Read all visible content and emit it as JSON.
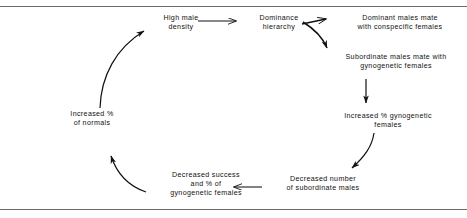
{
  "figure": {
    "background_color": "#ffffff",
    "line_color": "#111111",
    "rule_color": "#6a6a6a"
  },
  "nodes": [
    {
      "id": "high-male-density",
      "lines": [
        "High male",
        "density"
      ]
    },
    {
      "id": "dominance-hierarchy",
      "lines": [
        "Dominance",
        "hierarchy"
      ]
    },
    {
      "id": "dominant-males",
      "lines": [
        "Dominant males mate",
        "with conspecific females"
      ]
    },
    {
      "id": "subordinate-males-mate",
      "lines": [
        "Subordinate males mate with",
        "gynogenetic females"
      ]
    },
    {
      "id": "increased-gyno",
      "lines": [
        "Increased % gynogenetic",
        "females"
      ]
    },
    {
      "id": "decreased-number",
      "lines": [
        "Decreased number",
        "of subordinate males"
      ]
    },
    {
      "id": "decreased-success",
      "lines": [
        "Decreased success",
        "and % of",
        "gynogenetic females"
      ]
    },
    {
      "id": "increased-normals",
      "lines": [
        "Increased %",
        "of  normals"
      ]
    }
  ],
  "edges": [
    {
      "id": "high-male-density-to-dominance-hierarchy",
      "shape": "straight",
      "direction": "right"
    },
    {
      "id": "dominance-hierarchy-to-dominant-males",
      "shape": "straight",
      "direction": "right"
    },
    {
      "id": "dominance-hierarchy-to-subordinate-males",
      "shape": "curved",
      "direction": "down-right"
    },
    {
      "id": "subordinate-males-to-increased-gyno",
      "shape": "straight",
      "direction": "down"
    },
    {
      "id": "increased-gyno-to-decreased-number",
      "shape": "curved",
      "direction": "down-left"
    },
    {
      "id": "decreased-number-to-decreased-success",
      "shape": "straight",
      "direction": "left"
    },
    {
      "id": "decreased-success-to-increased-normals",
      "shape": "curved",
      "direction": "up-left"
    },
    {
      "id": "increased-normals-to-high-male-density",
      "shape": "curved",
      "direction": "up-right"
    }
  ]
}
